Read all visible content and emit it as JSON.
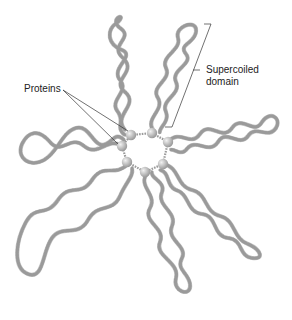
{
  "diagram": {
    "labels": {
      "proteins": "Proteins",
      "supercoiled_line1": "Supercoiled",
      "supercoiled_line2": "domain"
    },
    "colors": {
      "dna_strand": "#9a9a9a",
      "protein": "#bdbdbd",
      "leader_line": "#333333",
      "background": "#ffffff"
    },
    "hub": {
      "cx": 148,
      "cy": 150,
      "protein_count": 7
    },
    "domain_count": 7
  }
}
